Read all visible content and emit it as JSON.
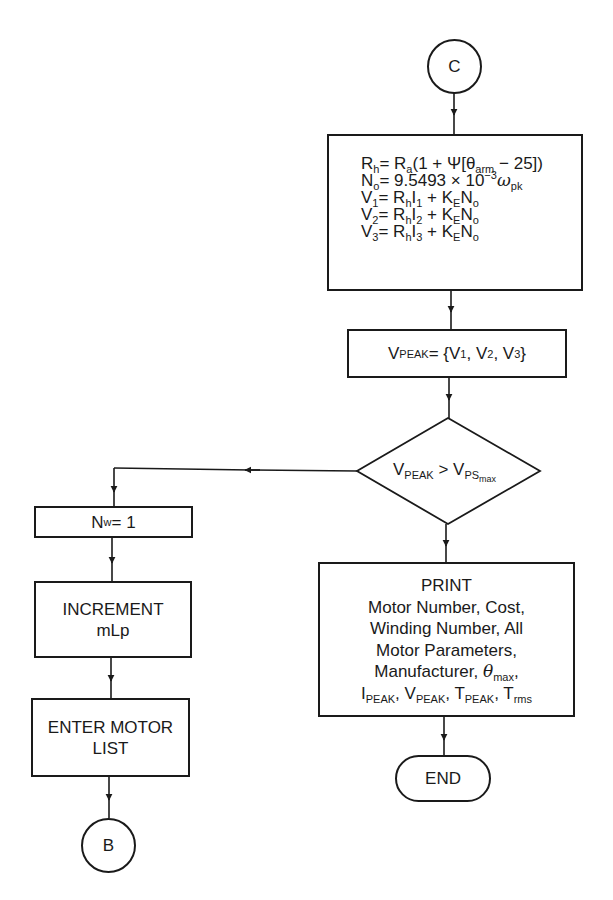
{
  "connectors": {
    "start": "C",
    "end_offpage": "B"
  },
  "compute_box": {
    "lines": [
      {
        "lhs": "R",
        "lhs_sub": "h",
        "rhs": "= R",
        "rhs_sub": "a",
        "rest": "(1 + Ψ[θ",
        "rest_sub": "arm",
        "tail": " − 25])"
      },
      {
        "lhs": "N",
        "lhs_sub": "o",
        "rhs": "= 9.5493 × 10",
        "rhs_sup": "−3",
        "rest": "ω",
        "rest_sub": "pk"
      },
      {
        "lhs": "V",
        "lhs_sub": "1",
        "rhs": "= R",
        "rhs_sub": "h",
        "rest": "I",
        "rest_sub": "1",
        "tail": " + K",
        "tail_sub": "E",
        "end": "N",
        "end_sub": "o"
      },
      {
        "lhs": "V",
        "lhs_sub": "2",
        "rhs": "= R",
        "rhs_sub": "h",
        "rest": "I",
        "rest_sub": "2",
        "tail": " + K",
        "tail_sub": "E",
        "end": "N",
        "end_sub": "o"
      },
      {
        "lhs": "V",
        "lhs_sub": "3",
        "rhs": "= R",
        "rhs_sub": "h",
        "rest": "I",
        "rest_sub": "3",
        "tail": " + K",
        "tail_sub": "E",
        "end": "N",
        "end_sub": "o"
      }
    ]
  },
  "vpeak_box": {
    "lhs": "V",
    "lhs_sub": "PEAK",
    "eq": " = {V",
    "v1_sub": "1",
    "sep1": ", V",
    "v2_sub": "2",
    "sep2": ", V",
    "v3_sub": "3",
    "close": "}"
  },
  "decision": {
    "lhs": "V",
    "lhs_sub": "PEAK",
    "op": " > V",
    "rhs_sub": "PS",
    "rhs_subsub": "max"
  },
  "left_branch": {
    "nw_box": {
      "text": "N",
      "sub": "w",
      "value": " = 1"
    },
    "increment_box": {
      "line1": "INCREMENT",
      "line2": "mLp"
    },
    "enter_box": {
      "line1": "ENTER MOTOR",
      "line2": "LIST"
    }
  },
  "print_box": {
    "title": "PRINT",
    "line1": "Motor Number, Cost,",
    "line2": "Winding Number, All",
    "line3": "Motor Parameters,",
    "line4_prefix": "Manufacturer, ",
    "line4_theta": "θ",
    "line4_sub": "max",
    "line4_suffix": ",",
    "line5": [
      {
        "sym": "I",
        "sub": "PEAK",
        "sep": ", "
      },
      {
        "sym": "V",
        "sub": "PEAK",
        "sep": ", "
      },
      {
        "sym": "T",
        "sub": "PEAK",
        "sep": ", "
      },
      {
        "sym": "T",
        "sub": "rms",
        "sep": ""
      }
    ]
  },
  "terminator": {
    "label": "END"
  },
  "colors": {
    "line": "#1a1a1a",
    "background": "#ffffff"
  }
}
